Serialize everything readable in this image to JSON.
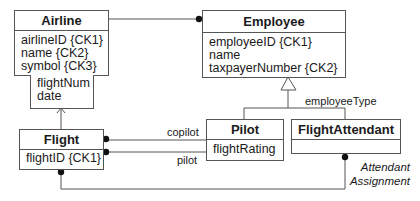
{
  "classes": {
    "airline": {
      "name": "Airline",
      "attributes": [
        "airlineID {CK1}",
        "name {CK2}",
        "symbol {CK3}"
      ]
    },
    "qualifier": {
      "attributes": [
        "flightNum",
        "date"
      ]
    },
    "employee": {
      "name": "Employee",
      "attributes": [
        "employeeID {CK1}",
        "name",
        "taxpayerNumber {CK2}"
      ]
    },
    "flight": {
      "name": "Flight",
      "attributes": [
        "flightID {CK1}"
      ]
    },
    "pilot": {
      "name": "Pilot",
      "attributes": [
        "flightRating"
      ]
    },
    "flightAttendant": {
      "name": "FlightAttendant",
      "attributes": []
    }
  },
  "labels": {
    "generalization": "employeeType",
    "copilot": "copilot",
    "pilot": "pilot",
    "association_line1": "Attendant",
    "association_line2": "Assignment"
  }
}
